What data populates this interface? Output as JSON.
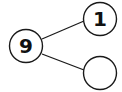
{
  "diagram": {
    "type": "number-bond",
    "whole": {
      "label": "9"
    },
    "parts": [
      {
        "label": "1"
      },
      {
        "label": ""
      }
    ],
    "colors": {
      "stroke": "#1a1a1a",
      "text": "#111111",
      "background": "#ffffff"
    }
  }
}
